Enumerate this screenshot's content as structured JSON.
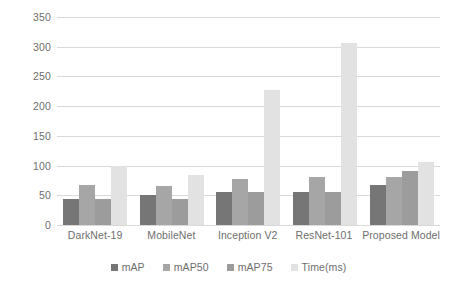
{
  "chart_data": {
    "type": "bar",
    "title": "",
    "xlabel": "",
    "ylabel": "",
    "ylim": [
      0,
      350
    ],
    "yticks": [
      0,
      50,
      100,
      150,
      200,
      250,
      300,
      350
    ],
    "ytick_labels": [
      "0",
      "50",
      "100",
      "150",
      "200",
      "250",
      "300",
      "350"
    ],
    "grid": true,
    "legend_position": "bottom",
    "categories": [
      "DarkNet-19",
      "MobileNet",
      "Inception V2",
      "ResNet-101",
      "Proposed Model"
    ],
    "series": [
      {
        "name": "mAP",
        "color": "#767676",
        "values": [
          44,
          50,
          55,
          56,
          67
        ]
      },
      {
        "name": "mAP50",
        "color": "#a6a6a6",
        "values": [
          67,
          65,
          77,
          80,
          81
        ]
      },
      {
        "name": "mAP75",
        "color": "#9c9c9c",
        "values": [
          44,
          44,
          56,
          56,
          91
        ]
      },
      {
        "name": "Time(ms)",
        "color": "#e2e2e2",
        "values": [
          99,
          84,
          228,
          307,
          106
        ]
      }
    ]
  },
  "legend": {
    "items": [
      {
        "label": "mAP",
        "color": "#767676"
      },
      {
        "label": "mAP50",
        "color": "#a6a6a6"
      },
      {
        "label": "mAP75",
        "color": "#9c9c9c"
      },
      {
        "label": "Time(ms)",
        "color": "#e2e2e2"
      }
    ]
  },
  "colors": {
    "gridline": "#d9d9d9",
    "tick_text": "#6e6e6e",
    "background": "#ffffff"
  }
}
